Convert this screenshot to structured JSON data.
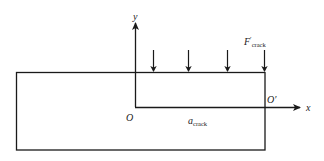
{
  "diagram": {
    "labels": {
      "y_axis": "y",
      "x_axis": "x",
      "origin": "O",
      "origin_prime": "O′",
      "crack_length_main": "a",
      "crack_length_sub": "crack",
      "force_main": "F",
      "force_prime": "′",
      "force_sub": "crack"
    },
    "colors": {
      "line": "#1a1a1a",
      "text": "#222222",
      "background": "#ffffff"
    },
    "force_arrow_count": 4
  }
}
